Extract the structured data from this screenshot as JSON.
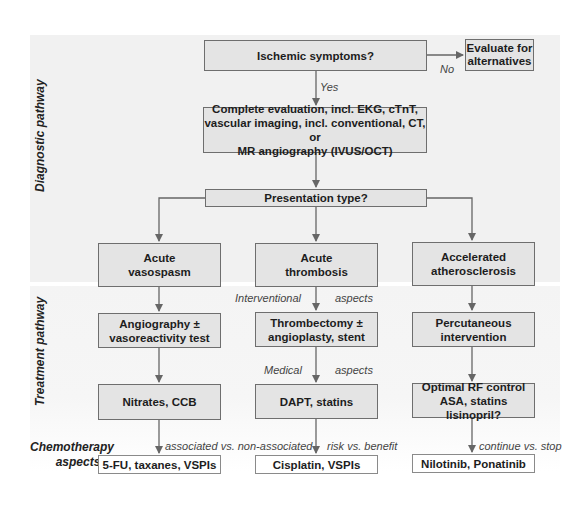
{
  "bands": {
    "diagnostic": "Diagnostic pathway",
    "treatment": "Treatment pathway"
  },
  "chemo_label": {
    "line1": "Chemotherapy",
    "line2": "aspects"
  },
  "nodes": {
    "ischemic": "Ischemic symptoms?",
    "evaluate_line1": "Evaluate for",
    "evaluate_line2": "alternatives",
    "complete_line1": "Complete evaluation, incl. EKG, cTnT,",
    "complete_line2": "vascular imaging, incl. conventional, CT, or",
    "complete_line3": "MR angiography (IVUS/OCT)",
    "presentation": "Presentation type?",
    "vasospasm_line1": "Acute",
    "vasospasm_line2": "vasospasm",
    "thrombosis_line1": "Acute",
    "thrombosis_line2": "thrombosis",
    "athero_line1": "Accelerated",
    "athero_line2": "atherosclerosis",
    "angiography_line1": "Angiography ±",
    "angiography_line2": "vasoreactivity test",
    "thrombectomy_line1": "Thrombectomy ±",
    "thrombectomy_line2": "angioplasty, stent",
    "percutaneous_line1": "Percutaneous",
    "percutaneous_line2": "intervention",
    "nitrates": "Nitrates, CCB",
    "dapt": "DAPT, statins",
    "optimal_line1": "Optimal RF control",
    "optimal_line2": "ASA, statins lisinopril?",
    "fu": "5-FU, taxanes, VSPIs",
    "cisplatin": "Cisplatin, VSPIs",
    "nilotinib": "Nilotinib, Ponatinib"
  },
  "edge_labels": {
    "no": "No",
    "yes": "Yes",
    "interventional": "Interventional",
    "interventional_aspects": "aspects",
    "medical": "Medical",
    "medical_aspects": "aspects",
    "associated": "associated vs. non-associated",
    "risk": "risk vs. benefit",
    "continue": "continue vs. stop"
  },
  "colors": {
    "box_fill": "#e4e4e4",
    "box_border": "#6e6e6e",
    "band_fill": "#f1f1f1",
    "arrow": "#666666"
  }
}
